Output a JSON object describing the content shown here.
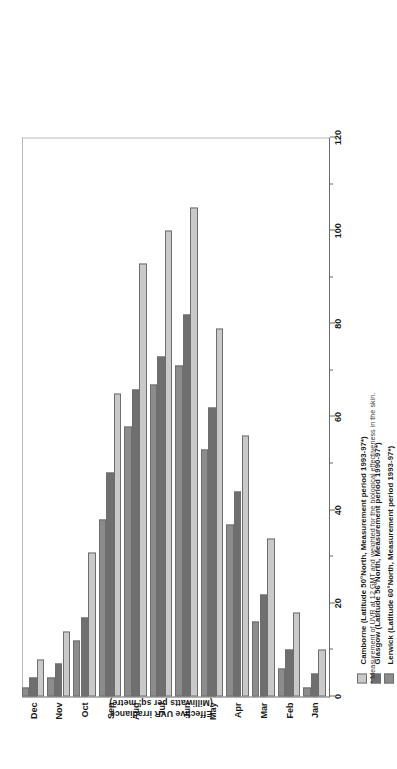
{
  "chart_data": {
    "type": "bar",
    "orientation": "vertical",
    "title": "",
    "xlabel": "",
    "ylabel": "Effective UVR irradiance (Milliwatts per sq. metre)",
    "ylabel_line1": "Effective UVR irradiance",
    "ylabel_line2": "(Milliwatts per sq. metre)",
    "ylim": [
      0,
      120
    ],
    "ytick_values": [
      0,
      20,
      40,
      60,
      80,
      100,
      120
    ],
    "ytick_labels": [
      "0",
      "20",
      "40",
      "60",
      "80",
      "100",
      "120"
    ],
    "yminor_values": [
      10,
      30,
      50,
      70,
      90,
      110
    ],
    "grid": false,
    "legend_position": "below",
    "categories": [
      "Jan",
      "Feb",
      "Mar",
      "Apr",
      "May",
      "Jun",
      "Jul",
      "Aug",
      "Sep",
      "Oct",
      "Nov",
      "Dec"
    ],
    "series": [
      {
        "name": "Camborne",
        "legend_label": "Camborne  (Latitude 50°North, Measurement period 1993-97*)",
        "color": "#c9c9c9",
        "values": [
          10,
          18,
          34,
          56,
          79,
          105,
          100,
          93,
          65,
          31,
          14,
          8
        ]
      },
      {
        "name": "Glasgow",
        "legend_label": "Glasgow (Latitude 56°North, Measurement period 1990-97*)",
        "color": "#6f6f6f",
        "values": [
          5,
          10,
          22,
          44,
          62,
          82,
          73,
          66,
          48,
          17,
          7,
          4
        ]
      },
      {
        "name": "Lerwick",
        "legend_label": "Lerwick (Latitude 60°North, Measurement period 1993-97*)",
        "color": "#8c8c8c",
        "values": [
          2,
          6,
          16,
          37,
          53,
          71,
          67,
          58,
          38,
          12,
          4,
          2
        ]
      }
    ],
    "footnote": "* Measurement of UVR at 12 GMT and weighted for the biological effectiveness in the skin."
  }
}
